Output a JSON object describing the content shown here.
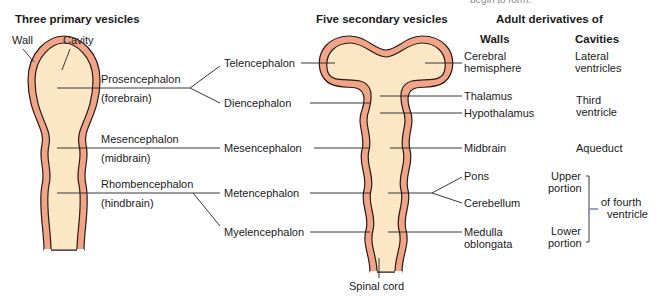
{
  "top_cut_text": {
    "left": "",
    "right": "begin to form."
  },
  "headings": {
    "primary": "Three primary vesicles",
    "secondary": "Five secondary vesicles",
    "adult": "Adult derivatives of",
    "walls": "Walls",
    "cavities": "Cavities"
  },
  "primary_labels": {
    "wall": "Wall",
    "cavity": "Cavity",
    "vesicles": [
      {
        "name": "Prosencephalon",
        "common": "(forebrain)"
      },
      {
        "name": "Mesencephalon",
        "common": "(midbrain)"
      },
      {
        "name": "Rhombencephalon",
        "common": "(hindbrain)"
      }
    ]
  },
  "secondary_vesicles": [
    "Telencephalon",
    "Diencephalon",
    "Mesencephalon",
    "Metencephalon",
    "Myelencephalon"
  ],
  "walls": [
    {
      "line1": "Cerebral",
      "line2": "hemisphere"
    },
    {
      "line1": "Thalamus"
    },
    {
      "line1": "Hypothalamus"
    },
    {
      "line1": "Midbrain"
    },
    {
      "line1": "Pons"
    },
    {
      "line1": "Cerebellum"
    },
    {
      "line1": "Medulla",
      "line2": "oblongata"
    }
  ],
  "cavities": [
    {
      "line1": "Lateral",
      "line2": "ventricles"
    },
    {
      "line1": "Third",
      "line2": "ventricle"
    },
    {
      "line1": "Aqueduct"
    },
    {
      "line1": "Upper",
      "line2": "portion"
    },
    {
      "line1": "Lower",
      "line2": "portion"
    },
    {
      "line1": "of fourth",
      "line2": "ventricle"
    }
  ],
  "spinal_cord": "Spinal cord",
  "colors": {
    "wall": "#f0a488",
    "cavity": "#fbe7c6",
    "outline": "#2a1a14",
    "line": "#222222",
    "bracket_tick": "#3a3aa0"
  }
}
